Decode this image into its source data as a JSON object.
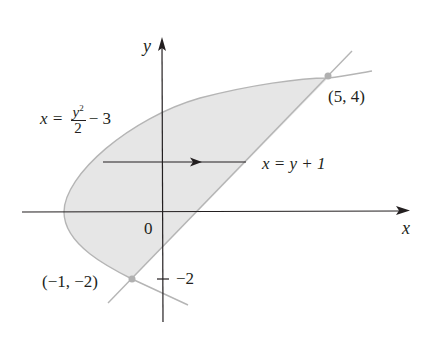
{
  "diagram": {
    "axes": {
      "x_label": "x",
      "y_label": "y",
      "origin_label": "0",
      "tick_label_y": "−2"
    },
    "curves": {
      "parabola_eq_lhs": "x = ",
      "parabola_num": "y",
      "parabola_exp": "2",
      "parabola_den": "2",
      "parabola_tail": "− 3",
      "line_eq": "x = y + 1"
    },
    "points": [
      {
        "label": "(5, 4)",
        "x": 5,
        "y": 4
      },
      {
        "label": "(−1, −2)",
        "x": -1,
        "y": -2
      }
    ],
    "region": "shaded region between x = y²/2 − 3 and x = y + 1",
    "colors": {
      "fill": "#e6e6e6",
      "curve": "#b5b5b5",
      "axis": "#231f20",
      "point": "#b0b0b0"
    }
  }
}
